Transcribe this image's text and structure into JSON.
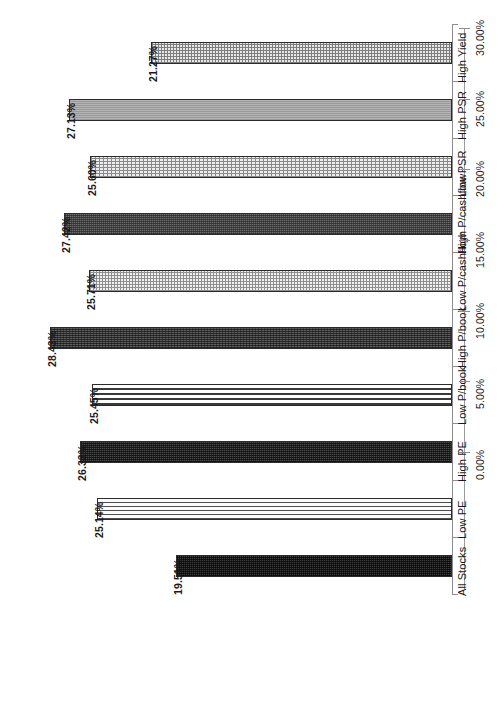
{
  "chart_data": {
    "type": "bar",
    "orientation": "vertical-rotated",
    "title": "",
    "subtitle": "",
    "xlabel": "",
    "ylabel": "",
    "categories": [
      "High Yield",
      "High PSR",
      "Low PSR",
      "High P/cashflow",
      "Low P/cashflow",
      "High P/book",
      "Low P/book",
      "High PE",
      "Low PE",
      "All Stocks"
    ],
    "values": [
      21.27,
      27.13,
      25.6,
      27.42,
      25.71,
      28.43,
      25.45,
      26.33,
      25.14,
      19.51
    ],
    "data_labels": [
      "21.27%",
      "27.13%",
      "25.60%",
      "27.42%",
      "25.71%",
      "28.43%",
      "25.45%",
      "26.33%",
      "25.14%",
      "19.51%"
    ],
    "ylim": [
      0,
      30
    ],
    "ytick_values": [
      0,
      5,
      10,
      15,
      20,
      25,
      30
    ],
    "ytick_labels": [
      "0.00%",
      "5.00%",
      "10.00%",
      "15.00%",
      "20.00%",
      "25.00%",
      "30.00%"
    ],
    "grid": false,
    "legend": null,
    "legend_position": "none",
    "bar_patterns": [
      "grid-light",
      "solid-mid",
      "grid-fine",
      "dark-dots",
      "dots-light",
      "dark-check",
      "hstripe",
      "darker-check",
      "hstripe-fine",
      "darkest"
    ],
    "colors": {
      "axis": "#8c8c8c",
      "bar_border": "#2b2b2b",
      "text": "#1a1a1a",
      "background": "#ffffff"
    }
  }
}
